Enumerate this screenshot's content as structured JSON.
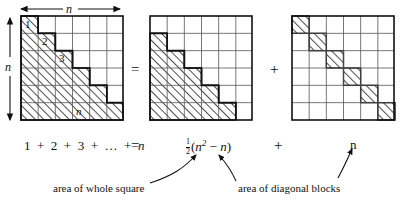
{
  "figure": {
    "type": "math-identity-diagram"
  },
  "dimensions": {
    "top_arrow_label": "n",
    "left_arrow_label": "n"
  },
  "grids": [
    {
      "id": "staircase-square",
      "cells_per_side": 6,
      "shading": "staircase",
      "row_shaded_counts": [
        1,
        2,
        3,
        4,
        5,
        6
      ],
      "labels": [
        {
          "text": "1",
          "row": 1,
          "col": 1,
          "italic": false
        },
        {
          "text": "2",
          "row": 2,
          "col": 2,
          "italic": false
        },
        {
          "text": "3",
          "row": 3,
          "col": 3,
          "italic": false
        },
        {
          "text": "n",
          "row": 6,
          "col": 4,
          "italic": true
        }
      ]
    },
    {
      "id": "lower-triangle-square",
      "cells_per_side": 6,
      "shading": "strict-lower-triangle",
      "row_shaded_counts": [
        0,
        1,
        2,
        3,
        4,
        5
      ],
      "labels": []
    },
    {
      "id": "diagonal-square",
      "cells_per_side": 6,
      "shading": "main-diagonal",
      "row_shaded_counts": [
        1,
        1,
        1,
        1,
        1,
        1
      ],
      "labels": []
    }
  ],
  "operators": {
    "equals_top": "=",
    "plus_top": "+",
    "equals_bottom": "=",
    "plus_bottom": "+"
  },
  "equation": {
    "left": "1 + 2 + 3 + … + n",
    "left_terms": [
      "1",
      "2",
      "3",
      "…",
      "n"
    ],
    "right_first_fraction_num": "1",
    "right_first_fraction_den": "2",
    "right_first_expr_open": "(",
    "right_first_n": "n",
    "right_first_exponent": "2",
    "right_first_minus": "−",
    "right_first_second_n": "n",
    "right_first_expr_close": ")",
    "right_second": "n"
  },
  "annotations": [
    {
      "id": "caption-whole-square",
      "text": "area of whole square"
    },
    {
      "id": "caption-diagonal-blocks",
      "text": "area of diagonal blocks"
    }
  ],
  "colors": {
    "ink": "#111111",
    "grid_line": "#555555",
    "hatch": "#222222",
    "background": "#ffffff"
  }
}
